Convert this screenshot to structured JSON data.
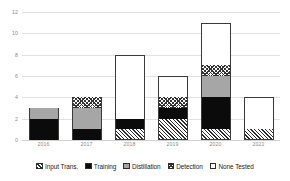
{
  "chart_data": {
    "type": "bar",
    "stacked": true,
    "title": "",
    "subtitle": "",
    "xlabel": "",
    "ylabel": "",
    "categories": [
      "2016",
      "2017",
      "2018",
      "2019",
      "2020",
      "2021"
    ],
    "series": [
      {
        "name": "Input Trans.",
        "pattern": "diagonal-hatch",
        "values": [
          0,
          0,
          1,
          2,
          1,
          1
        ]
      },
      {
        "name": "Training",
        "pattern": "solid-black",
        "values": [
          2,
          1,
          1,
          1,
          3,
          0
        ]
      },
      {
        "name": "Distillation",
        "pattern": "solid-gray",
        "values": [
          1,
          2,
          0,
          0,
          2,
          0
        ]
      },
      {
        "name": "Detection",
        "pattern": "checkerboard",
        "values": [
          0,
          1,
          0,
          1,
          1,
          0
        ]
      },
      {
        "name": "None Tested",
        "pattern": "white-outline",
        "values": [
          0,
          0,
          6,
          2,
          4,
          3
        ]
      }
    ],
    "totals": [
      3,
      4,
      8,
      6,
      11,
      4
    ],
    "yticks": [
      "0",
      "2",
      "4",
      "6",
      "8",
      "10",
      "12"
    ],
    "ylim": [
      0,
      12
    ],
    "grid": true,
    "legend_position": "bottom",
    "colors": {
      "training": "#0b0b0b",
      "distillation": "#a6a6a6",
      "hatch_stroke": "#2b2b2b",
      "outline": "#3a3a3a",
      "gridline": "#e2e2e2",
      "tick_text": "#8a8a8a",
      "legend_text": "#222222",
      "background": "#ffffff"
    }
  },
  "legend": {
    "items": [
      {
        "label": "Input Trans.",
        "swatch": "hatch-swatch"
      },
      {
        "label": "Training",
        "swatch": "black-swatch"
      },
      {
        "label": "Distillation",
        "swatch": "gray-swatch"
      },
      {
        "label": "Detection",
        "swatch": "checker-swatch"
      },
      {
        "label": "None Tested",
        "swatch": "white-swatch"
      }
    ]
  }
}
